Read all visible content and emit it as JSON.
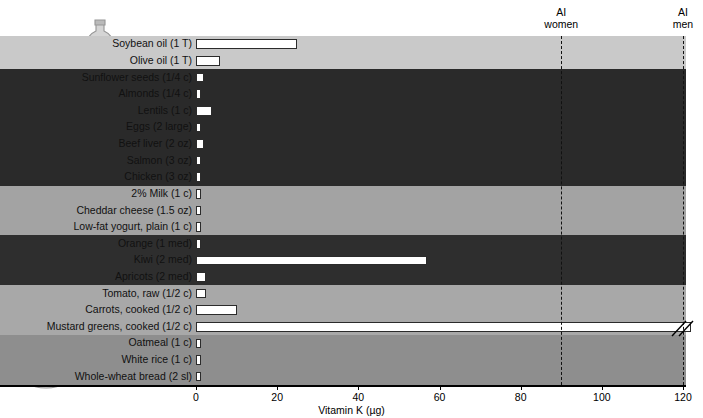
{
  "chart_data": {
    "type": "bar",
    "orientation": "horizontal",
    "title": "",
    "xlabel": "Vitamin K (µg)",
    "ylabel": "",
    "xlim": [
      0,
      120
    ],
    "xticks": [
      0,
      20,
      40,
      60,
      80,
      100,
      120
    ],
    "grid": false,
    "legend": "none",
    "categories": [
      "Soybean oil (1 T)",
      "Olive oil (1 T)",
      "Sunflower seeds (1/4 c)",
      "Almonds (1/4 c)",
      "Lentils (1 c)",
      "Eggs (2 large)",
      "Beef liver (2 oz)",
      "Salmon (3 oz)",
      "Chicken (3 oz)",
      "2% Milk (1 c)",
      "Cheddar cheese (1.5 oz)",
      "Low-fat yogurt, plain (1 c)",
      "Orange (1 med)",
      "Kiwi (2 med)",
      "Apricots (2 med)",
      "Tomato, raw (1/2 c)",
      "Carrots, cooked (1/2 c)",
      "Mustard greens, cooked (1/2 c)",
      "Oatmeal (1 c)",
      "White rice (1 c)",
      "Whole-wheat bread (2 sl)"
    ],
    "values": [
      25,
      6,
      2,
      1,
      4,
      0.6,
      2,
      0.5,
      0.2,
      0.4,
      1,
      0.3,
      0.3,
      57,
      2.5,
      2.5,
      10,
      125,
      1.2,
      0.2,
      1.2
    ],
    "off_scale": [
      false,
      false,
      false,
      false,
      false,
      false,
      false,
      false,
      false,
      false,
      false,
      false,
      false,
      false,
      false,
      false,
      false,
      true,
      false,
      false,
      false
    ],
    "annotations": [
      {
        "name": "ai-women",
        "label_line1": "AI",
        "label_line2": "women",
        "value": 90
      },
      {
        "name": "ai-men",
        "label_line1": "AI",
        "label_line2": "men",
        "value": 120
      }
    ],
    "food_groups": [
      {
        "name": "Fats and oils",
        "start": 0,
        "end": 1,
        "shade": "#c9c9c9"
      },
      {
        "name": "Protein foods",
        "start": 2,
        "end": 8,
        "shade": "#2a2a2a"
      },
      {
        "name": "Dairy",
        "start": 9,
        "end": 11,
        "shade": "#a3a3a3"
      },
      {
        "name": "Fruits",
        "start": 12,
        "end": 14,
        "shade": "#2e2e2e"
      },
      {
        "name": "Vegetables",
        "start": 15,
        "end": 17,
        "shade": "#a8a8a8"
      },
      {
        "name": "Grains",
        "start": 18,
        "end": 20,
        "shade": "#8e8e8e"
      }
    ]
  },
  "illustrations": [
    {
      "name": "oils-illustration",
      "caption": "bottle and jar of oil"
    },
    {
      "name": "protein-illustration",
      "caption": "nuts, lentils, meat and fish"
    },
    {
      "name": "dairy-illustration",
      "caption": "cheese wedge and milk glass"
    },
    {
      "name": "fruits-illustration",
      "caption": "apple, grapes and pear"
    },
    {
      "name": "vegetables-illustration",
      "caption": "lettuce, carrot and tomato"
    },
    {
      "name": "grains-illustration",
      "caption": "bread slices and cereal bowl"
    }
  ]
}
